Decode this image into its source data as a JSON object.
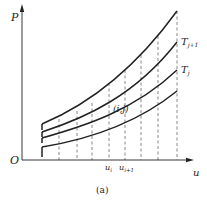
{
  "figure": {
    "caption": "(a)",
    "axes": {
      "y_label": "P",
      "x_label": "u",
      "origin_label": "O"
    },
    "curve_labels": {
      "upper": "T",
      "upper_sub": "j+1",
      "lower": "T",
      "lower_sub": "j"
    },
    "node_label": "(i,j)",
    "x_ticks": [
      {
        "label": "u",
        "sub": "i"
      },
      {
        "label": "u",
        "sub": "i+1"
      }
    ],
    "colors": {
      "line": "#222222",
      "dash": "#555555",
      "background": "#ffffff"
    }
  }
}
